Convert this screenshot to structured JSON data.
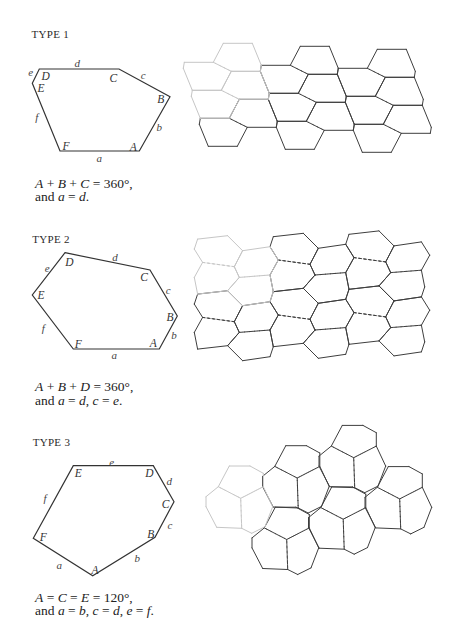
{
  "figure": {
    "types": [
      {
        "title": "TYPE 1",
        "hexagon": {
          "points": "39.3,69 119,69 170,96.7 139.3,151 60,151 32.3,83.3",
          "vertex_labels": [
            {
              "text": "D",
              "x": 45.7,
              "y": 76
            },
            {
              "text": "C",
              "x": 113.3,
              "y": 77.7
            },
            {
              "text": "B",
              "x": 160.7,
              "y": 99.3
            },
            {
              "text": "A",
              "x": 133.3,
              "y": 146.7
            },
            {
              "text": "F",
              "x": 66,
              "y": 146.3
            },
            {
              "text": "E",
              "x": 41,
              "y": 88.3
            }
          ],
          "edge_labels": [
            {
              "text": "d",
              "x": 77.3,
              "y": 62.7
            },
            {
              "text": "c",
              "x": 143.3,
              "y": 75.3
            },
            {
              "text": "b",
              "x": 159.3,
              "y": 127.3
            },
            {
              "text": "a",
              "x": 99.3,
              "y": 158
            },
            {
              "text": "f",
              "x": 36.7,
              "y": 117.3
            },
            {
              "text": "e",
              "x": 30.7,
              "y": 71.7
            }
          ]
        },
        "conditions": [
          "*A* + *B* + *C* = 360°,",
          "and *a* = *d*."
        ],
        "tiling": {
          "origin": [
            269.3,
            93.3
          ],
          "u": [
            77,
            3
          ],
          "s": [
            8,
            28
          ],
          "r_offset": [
            39,
            -19
          ],
          "templates": {
            "O": {
              "points": [
                [
                  0,
                  0
                ],
                [
                  29,
                  0
                ],
                [
                  47,
                  9
                ],
                [
                  37,
                  28
                ],
                [
                  8,
                  28
                ],
                [
                  -1,
                  6
                ]
              ],
              "dashed": [
                1
              ]
            },
            "R": {
              "points": [
                [
                  0,
                  0
                ],
                [
                  29,
                  0
                ],
                [
                  38,
                  22
                ],
                [
                  37,
                  28
                ],
                [
                  8,
                  28
                ],
                [
                  -10,
                  19
                ]
              ],
              "dashed": [
                4
              ]
            }
          },
          "tiles": [
            {
              "kind": "O",
              "k": -1,
              "m": -1,
              "light": true
            },
            {
              "kind": "R",
              "k": -1,
              "m": -1,
              "light": true
            },
            {
              "kind": "O",
              "k": 0,
              "m": -1,
              "light": false
            },
            {
              "kind": "R",
              "k": 0,
              "m": -1,
              "light": false
            },
            {
              "kind": "O",
              "k": 1,
              "m": -1,
              "light": false
            },
            {
              "kind": "R",
              "k": 1,
              "m": -1,
              "light": false
            },
            {
              "kind": "O",
              "k": -1,
              "m": 0,
              "light": true
            },
            {
              "kind": "R",
              "k": -1,
              "m": 0,
              "light": true
            },
            {
              "kind": "O",
              "k": 0,
              "m": 0,
              "light": false
            },
            {
              "kind": "R",
              "k": 0,
              "m": 0,
              "light": false
            },
            {
              "kind": "O",
              "k": 1,
              "m": 0,
              "light": false
            },
            {
              "kind": "R",
              "k": 1,
              "m": 0,
              "light": false
            },
            {
              "kind": "O",
              "k": -1,
              "m": 1,
              "light": false
            },
            {
              "kind": "R",
              "k": -1,
              "m": 1,
              "light": false
            },
            {
              "kind": "O",
              "k": 0,
              "m": 1,
              "light": false
            },
            {
              "kind": "R",
              "k": 0,
              "m": 1,
              "light": false
            },
            {
              "kind": "O",
              "k": 1,
              "m": 1,
              "light": false
            },
            {
              "kind": "R",
              "k": 1,
              "m": 1,
              "light": false
            }
          ]
        }
      },
      {
        "title": "TYPE 2",
        "hexagon": {
          "points": "65,252.7 150,270 177.3,316 159.3,349 73.3,349 32.3,295",
          "vertex_labels": [
            {
              "text": "D",
              "x": 69.3,
              "y": 261.7
            },
            {
              "text": "C",
              "x": 144,
              "y": 276.7
            },
            {
              "text": "B",
              "x": 170,
              "y": 317.3
            },
            {
              "text": "A",
              "x": 153.3,
              "y": 342.7
            },
            {
              "text": "F",
              "x": 78.3,
              "y": 344
            },
            {
              "text": "E",
              "x": 41,
              "y": 295
            }
          ],
          "edge_labels": [
            {
              "text": "d",
              "x": 115,
              "y": 256.7
            },
            {
              "text": "c",
              "x": 168.3,
              "y": 290
            },
            {
              "text": "b",
              "x": 174,
              "y": 335
            },
            {
              "text": "a",
              "x": 114.3,
              "y": 355
            },
            {
              "text": "f",
              "x": 43.3,
              "y": 328.3
            },
            {
              "text": "e",
              "x": 47.3,
              "y": 268.3
            }
          ]
        },
        "conditions": [
          "*A* + *B* + *D* = 360°,",
          "and *a* = *d*, *c* = *e*."
        ],
        "tiling": {
          "left_zigzag": [
            [
              273.3,
              236.7
            ],
            [
              270,
              246.7
            ],
            [
              278.3,
              260
            ],
            [
              270,
              275
            ]
          ],
          "right_zigzag": [
            [
              303.3,
              233.3
            ],
            [
              318.3,
              248.3
            ],
            [
              310,
              264.3
            ],
            [
              315,
              275
            ]
          ],
          "period_v": [
            0,
            55
          ],
          "period_h": [
            75.7,
            -2.4
          ],
          "columns": [
            -1,
            0,
            1
          ],
          "rows": [
            0,
            1
          ],
          "light_cells": [
            {
              "p": -1,
              "r": 0
            }
          ]
        }
      },
      {
        "title": "TYPE 3",
        "hexagon": {
          "points": "73.3,465.7 153.3,465.7 174,501.7 155,537.3 92.7,575.7 33.3,538.3",
          "vertex_labels": [
            {
              "text": "E",
              "x": 78.3,
              "y": 473.3
            },
            {
              "text": "D",
              "x": 149.3,
              "y": 472.7
            },
            {
              "text": "C",
              "x": 165.7,
              "y": 504
            },
            {
              "text": "B",
              "x": 150.7,
              "y": 534
            },
            {
              "text": "A",
              "x": 95,
              "y": 570
            },
            {
              "text": "F",
              "x": 43.3,
              "y": 536.7
            }
          ],
          "edge_labels": [
            {
              "text": "e",
              "x": 111.7,
              "y": 461.7
            },
            {
              "text": "d",
              "x": 169.3,
              "y": 480.7
            },
            {
              "text": "c",
              "x": 170,
              "y": 525
            },
            {
              "text": "b",
              "x": 137.3,
              "y": 558.3
            },
            {
              "text": "a",
              "x": 59.3,
              "y": 565
            },
            {
              "text": "f",
              "x": 45,
              "y": 498.3
            }
          ]
        },
        "conditions": [
          "*A* = *C* = *E* = 120°,",
          "and *a* = *b*, *c* = *d*, *e* = *f*."
        ],
        "tiling": {
          "origin": [
            240.7,
            498.3
          ],
          "a": [
            56.5,
            -20.3
          ],
          "b": [
            46,
            41.2
          ],
          "cluster_outline": [
            [
              -22.4,
              -11.6
            ],
            [
              -11.4,
              -32.3
            ],
            [
              9.3,
              -32.3
            ],
            [
              22.6,
              -25
            ],
            [
              22.6,
              -11.6
            ],
            [
              32,
              8.4
            ],
            [
              24.3,
              28.4
            ],
            [
              11,
              35
            ],
            [
              1,
              30
            ],
            [
              -24,
              29
            ],
            [
              -34.7,
              8.4
            ],
            [
              -34.7,
              -1.6
            ]
          ],
          "spokes": [
            0,
            4,
            8
          ],
          "clusters": [
            {
              "i": 0,
              "j": 0,
              "light": true
            },
            {
              "i": 1,
              "j": 0,
              "light": false
            },
            {
              "i": 2,
              "j": 0,
              "light": false
            },
            {
              "i": 0,
              "j": 1,
              "light": false
            },
            {
              "i": 1,
              "j": 1,
              "light": false
            },
            {
              "i": 2,
              "j": 1,
              "light": false
            }
          ]
        }
      }
    ]
  }
}
